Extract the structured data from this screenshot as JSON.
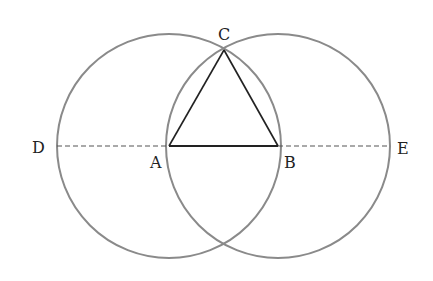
{
  "figure": {
    "points": {
      "A": {
        "label": "A"
      },
      "B": {
        "label": "B"
      },
      "C": {
        "label": "C"
      },
      "D": {
        "label": "D"
      },
      "E": {
        "label": "E"
      }
    },
    "circles": [
      {
        "name": "circle-centered-A",
        "center": "A",
        "through": "B"
      },
      {
        "name": "circle-centered-B",
        "center": "B",
        "through": "A"
      }
    ],
    "segments": [
      {
        "from": "A",
        "to": "B",
        "style": "solid"
      },
      {
        "from": "A",
        "to": "C",
        "style": "solid"
      },
      {
        "from": "B",
        "to": "C",
        "style": "solid"
      },
      {
        "from": "D",
        "to": "A",
        "style": "dashed"
      },
      {
        "from": "B",
        "to": "E",
        "style": "dashed"
      }
    ],
    "colors": {
      "circle": "#8a8a8a",
      "line": "#222222"
    }
  }
}
